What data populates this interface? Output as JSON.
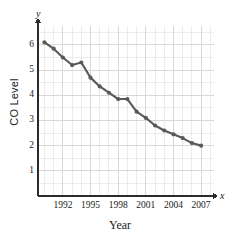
{
  "chart_data": {
    "type": "line",
    "title": "",
    "xlabel": "Year",
    "ylabel": "CO Level",
    "axis_letters": {
      "x": "x",
      "y": "y"
    },
    "x": [
      1990,
      1991,
      1992,
      1993,
      1994,
      1995,
      1996,
      1997,
      1998,
      1999,
      2000,
      2001,
      2002,
      2003,
      2004,
      2005,
      2006,
      2007
    ],
    "values": [
      6.1,
      5.85,
      5.5,
      5.2,
      5.3,
      4.7,
      4.35,
      4.1,
      3.85,
      3.85,
      3.35,
      3.1,
      2.8,
      2.6,
      2.45,
      2.3,
      2.1,
      2.0
    ],
    "series": [
      {
        "name": "CO Level",
        "values": [
          6.1,
          5.85,
          5.5,
          5.2,
          5.3,
          4.7,
          4.35,
          4.1,
          3.85,
          3.85,
          3.35,
          3.1,
          2.8,
          2.6,
          2.45,
          2.3,
          2.1,
          2.0
        ]
      }
    ],
    "xlim": [
      1989.3,
      2008.4
    ],
    "ylim": [
      0,
      6.75
    ],
    "xticks": [
      1992,
      1995,
      1998,
      2001,
      2004,
      2007
    ],
    "xtick_labels": [
      "1992",
      "1995",
      "1998",
      "2001",
      "2004",
      "2007"
    ],
    "yticks": [
      1,
      2,
      3,
      4,
      5,
      6
    ],
    "ytick_labels": [
      "1",
      "2",
      "3",
      "4",
      "5",
      "6"
    ],
    "grid": true,
    "grid_minor": true,
    "legend": "none",
    "line_color": "#595959",
    "marker": "circle",
    "marker_color": "#595959",
    "grid_color": "#d8d8d8",
    "grid_minor_color": "#ececec",
    "axis_color": "#2b2b2b"
  }
}
